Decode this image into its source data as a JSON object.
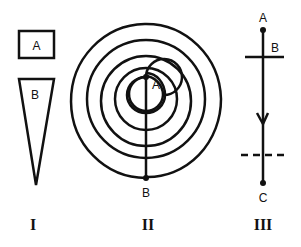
{
  "figures": [
    {
      "id": "I",
      "roman_label": "I",
      "shapes": [
        {
          "type": "rectangle",
          "label": "A"
        },
        {
          "type": "inverted-triangle",
          "label": "B"
        }
      ]
    },
    {
      "id": "II",
      "roman_label": "II",
      "shapes": [
        {
          "type": "spiral",
          "turns": 4
        },
        {
          "type": "line",
          "from": "A",
          "to": "B"
        }
      ],
      "points": {
        "A": "A",
        "B": "B"
      }
    },
    {
      "id": "III",
      "roman_label": "III",
      "shapes": [
        {
          "type": "vertical-line-with-arrow",
          "direction": "down"
        },
        {
          "type": "horizontal-line",
          "style": "solid",
          "label": "B"
        },
        {
          "type": "horizontal-line",
          "style": "dashed"
        }
      ],
      "points": {
        "A": "A",
        "B": "B",
        "C": "C"
      }
    }
  ],
  "colors": {
    "ink": "#111111",
    "background": "#ffffff"
  }
}
